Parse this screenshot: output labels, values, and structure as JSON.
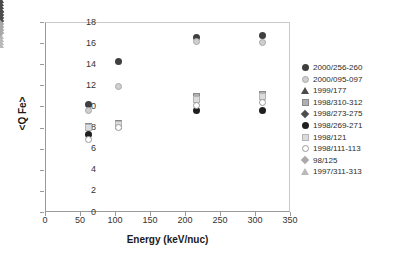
{
  "chart_data": {
    "type": "scatter",
    "title": "",
    "xlabel": "Energy (keV/nuc)",
    "ylabel": "<Q Fe>",
    "xlim": [
      0,
      350
    ],
    "ylim": [
      0,
      18
    ],
    "xticks": [
      0,
      50,
      100,
      150,
      200,
      250,
      300,
      350
    ],
    "yticks": [
      0,
      2,
      4,
      6,
      8,
      10,
      12,
      14,
      16,
      18
    ],
    "grid": false,
    "legend_position": "right",
    "x": [
      62,
      105,
      216,
      310
    ],
    "series": [
      {
        "name": "2000/256-260",
        "marker": "circle-dark",
        "x": [
          62,
          105,
          216,
          310
        ],
        "values": [
          10.2,
          14.3,
          16.5,
          16.7
        ]
      },
      {
        "name": "2000/095-097",
        "marker": "circle-light",
        "x": [
          62,
          105,
          216,
          310
        ],
        "values": [
          9.6,
          11.9,
          16.2,
          16.1
        ]
      },
      {
        "name": "1999/177",
        "marker": "triangle-filled",
        "x": [
          62,
          105,
          216,
          310
        ],
        "values": [
          7.6,
          9.3,
          11.5,
          11.6
        ]
      },
      {
        "name": "1998/310-312",
        "marker": "square-gray",
        "x": [
          62,
          105,
          216,
          310
        ],
        "values": [
          8.1,
          8.4,
          10.9,
          11.1
        ]
      },
      {
        "name": "1998/273-275",
        "marker": "diamond-dark",
        "x": [
          62,
          105,
          216,
          310
        ],
        "values": [
          7.8,
          8.2,
          10.3,
          10.6
        ]
      },
      {
        "name": "1998/269-271",
        "marker": "circle-black",
        "x": [
          62,
          105,
          216,
          310
        ],
        "values": [
          7.3,
          8.1,
          9.6,
          9.6
        ]
      },
      {
        "name": "1998/121",
        "marker": "square-light",
        "x": [
          62,
          105,
          216,
          310
        ],
        "values": [
          8.0,
          8.3,
          10.7,
          10.9
        ]
      },
      {
        "name": "1998/111-113",
        "marker": "circle-open",
        "x": [
          62,
          105,
          216,
          310
        ],
        "values": [
          6.9,
          8.0,
          10.1,
          10.4
        ]
      },
      {
        "name": "98/125",
        "marker": "diamond-gray",
        "x": [
          62,
          105,
          216,
          310
        ],
        "values": [
          7.5,
          8.2,
          10.0,
          9.3
        ]
      },
      {
        "name": "1997/311-313",
        "marker": "triangle-open",
        "x": [
          62,
          105,
          216,
          310
        ],
        "values": [
          8.2,
          9.4,
          11.8,
          12.6
        ]
      }
    ]
  }
}
